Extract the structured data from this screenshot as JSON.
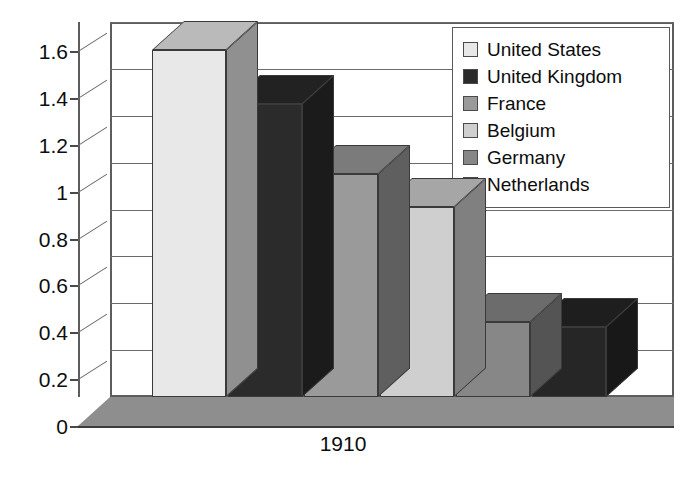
{
  "chart_data": {
    "type": "bar",
    "title": "",
    "subtitle": "",
    "xlabel": "",
    "ylabel": "",
    "categories": [
      "1910"
    ],
    "series": [
      {
        "name": "United States",
        "values": [
          1.48
        ],
        "color": "#e8e8e8"
      },
      {
        "name": "United Kingdom",
        "values": [
          1.25
        ],
        "color": "#2b2b2b"
      },
      {
        "name": "France",
        "values": [
          0.95
        ],
        "color": "#9a9a9a"
      },
      {
        "name": "Belgium",
        "values": [
          0.81
        ],
        "color": "#cfcfcf"
      },
      {
        "name": "Germany",
        "values": [
          0.32
        ],
        "color": "#878787"
      },
      {
        "name": "Netherlands",
        "values": [
          0.3
        ],
        "color": "#262626"
      }
    ],
    "ylim": [
      0,
      1.6
    ],
    "ytick_labels": [
      "0",
      "0.2",
      "0.4",
      "0.6",
      "0.8",
      "1",
      "1.2",
      "1.4",
      "1.6"
    ],
    "ytick_values": [
      0,
      0.2,
      0.4,
      0.6,
      0.8,
      1,
      1.2,
      1.4,
      1.6
    ],
    "grid": true,
    "legend_position": "top-right",
    "style": "3d-column-grayscale"
  },
  "legend": {
    "entries": [
      {
        "label": "United States",
        "swatch": "#e8e8e8"
      },
      {
        "label": "United Kingdom",
        "swatch": "#2b2b2b"
      },
      {
        "label": "France",
        "swatch": "#9a9a9a"
      },
      {
        "label": "Belgium",
        "swatch": "#cfcfcf"
      },
      {
        "label": "Germany",
        "swatch": "#878787"
      },
      {
        "label": "Netherlands",
        "swatch": "#262626"
      }
    ]
  },
  "colors": {
    "background": "#ffffff",
    "axis": "#5d5d5d",
    "gridline": "#6b6b6b",
    "text": "#0d0d0d",
    "floor": "#8e8e8e"
  }
}
